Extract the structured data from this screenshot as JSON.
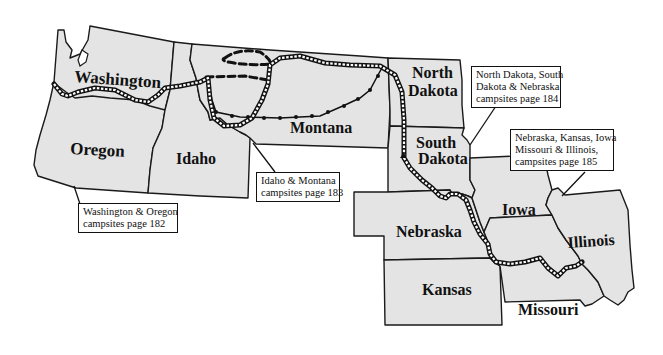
{
  "map": {
    "states": [
      {
        "id": "washington",
        "label": "Washington"
      },
      {
        "id": "oregon",
        "label": "Oregon"
      },
      {
        "id": "idaho",
        "label": "Idaho"
      },
      {
        "id": "montana",
        "label": "Montana"
      },
      {
        "id": "north-dakota",
        "label_lines": [
          "North",
          "Dakota"
        ]
      },
      {
        "id": "south-dakota",
        "label_lines": [
          "South",
          "Dakota"
        ]
      },
      {
        "id": "nebraska",
        "label": "Nebraska"
      },
      {
        "id": "iowa",
        "label": "Iowa"
      },
      {
        "id": "kansas",
        "label": "Kansas"
      },
      {
        "id": "missouri",
        "label": "Missouri"
      },
      {
        "id": "illinois",
        "label": "Illinois"
      }
    ],
    "callouts": [
      {
        "id": "wa-or",
        "lines": [
          "Washington & Oregon",
          "campsites page 182"
        ]
      },
      {
        "id": "id-mt",
        "lines": [
          "Idaho & Montana",
          "campsites page 183"
        ]
      },
      {
        "id": "nd-sd-ne",
        "lines": [
          "North Dakota, South",
          "Dakota & Nebraska",
          "campsites page 184"
        ]
      },
      {
        "id": "ne-ks-ia-mo-il",
        "lines": [
          "Nebraska, Kansas, Iowa",
          "Missouri & Illinois,",
          "campsites page 185"
        ]
      }
    ],
    "colors": {
      "state_fill": "#e4e4e4",
      "outline": "#1a1a1a",
      "background": "#ffffff"
    }
  }
}
